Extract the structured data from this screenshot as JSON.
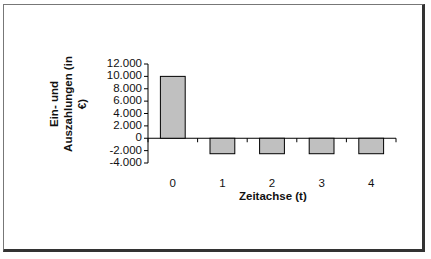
{
  "chart_data": {
    "type": "bar",
    "title": "",
    "xlabel": "Zeitachse (t)",
    "ylabel": "Ein- und Auszahlungen (in €)",
    "ylabel_lines": [
      "Ein- und",
      "Auszahlungen (in",
      "€)"
    ],
    "categories": [
      "0",
      "1",
      "2",
      "3",
      "4"
    ],
    "values": [
      10000,
      -2500,
      -2500,
      -2500,
      -2500
    ],
    "ylim": [
      -4000,
      12000
    ],
    "yticks": [
      12000,
      10000,
      8000,
      6000,
      4000,
      2000,
      0,
      -2000,
      -4000
    ],
    "ytick_labels": [
      "12.000",
      "10.000",
      "8.000",
      "6.000",
      "4.000",
      "2.000",
      "0",
      "-2.000",
      "-4.000"
    ],
    "grid": false,
    "legend": false,
    "bar_color": "#c0c0c0",
    "bar_edge_color": "#000000"
  }
}
